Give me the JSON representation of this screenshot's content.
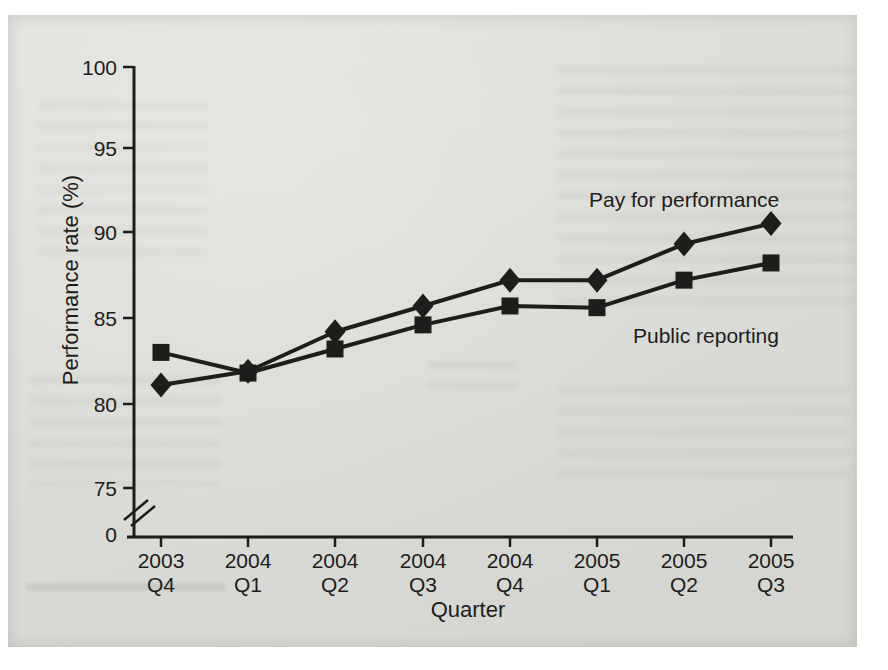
{
  "page": {
    "background_color": "#ffffff",
    "scan_background_color": "#dbdbd7",
    "ink_color": "#1d1d1b"
  },
  "chart_data": {
    "type": "line",
    "title": "",
    "xlabel": "Quarter",
    "ylabel": "Performance rate (%)",
    "x_tick_labels": [
      {
        "year": "2003",
        "quarter": "Q4"
      },
      {
        "year": "2004",
        "quarter": "Q1"
      },
      {
        "year": "2004",
        "quarter": "Q2"
      },
      {
        "year": "2004",
        "quarter": "Q3"
      },
      {
        "year": "2004",
        "quarter": "Q4"
      },
      {
        "year": "2005",
        "quarter": "Q1"
      },
      {
        "year": "2005",
        "quarter": "Q2"
      },
      {
        "year": "2005",
        "quarter": "Q3"
      }
    ],
    "y_ticks": [
      100,
      95,
      90,
      85,
      80,
      75
    ],
    "y_origin_label": "0",
    "axis_break": true,
    "ylim": [
      75,
      100
    ],
    "grid": false,
    "legend_position": "inline-labels",
    "series": [
      {
        "name": "Pay for performance",
        "marker": "diamond",
        "values": [
          81.1,
          81.9,
          84.2,
          85.7,
          87.2,
          87.2,
          89.3,
          90.5
        ]
      },
      {
        "name": "Public reporting",
        "marker": "square",
        "values": [
          83.0,
          81.8,
          83.2,
          84.6,
          85.7,
          85.6,
          87.2,
          88.2
        ]
      }
    ]
  }
}
